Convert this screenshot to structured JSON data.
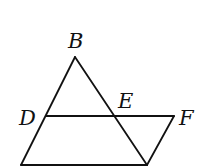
{
  "diagram": {
    "type": "geometry-figure",
    "points": {
      "B": {
        "label": "B",
        "x": 75,
        "y": 57,
        "label_x": 68,
        "label_y": 48
      },
      "D": {
        "label": "D",
        "x": 46,
        "y": 116,
        "label_x": 19,
        "label_y": 125
      },
      "E": {
        "label": "E",
        "x": 115,
        "y": 116,
        "label_x": 118,
        "label_y": 108
      },
      "F": {
        "label": "F",
        "x": 174,
        "y": 116,
        "label_x": 179,
        "label_y": 125
      },
      "A": {
        "x": 21,
        "y": 165
      },
      "C": {
        "x": 147,
        "y": 165
      }
    },
    "segments": [
      {
        "name": "segment-AB",
        "from": "A",
        "to": "B"
      },
      {
        "name": "segment-BC",
        "from": "B",
        "to": "C"
      },
      {
        "name": "segment-AC",
        "from": "A",
        "to": "C"
      },
      {
        "name": "segment-DF",
        "from": "D",
        "to": "F"
      },
      {
        "name": "segment-FC",
        "from": "F",
        "to": "C"
      }
    ],
    "stroke_color": "#111111"
  }
}
